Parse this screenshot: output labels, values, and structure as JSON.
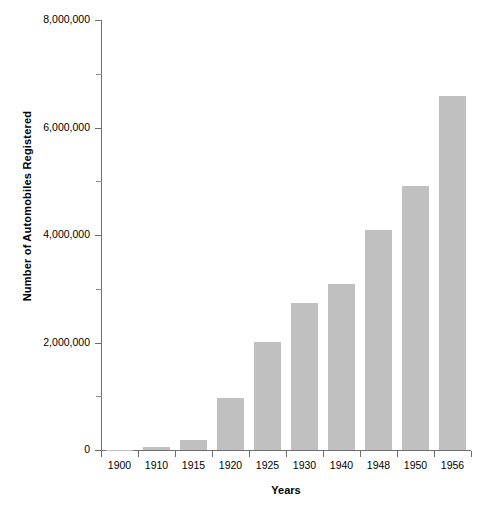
{
  "chart_data": {
    "type": "bar",
    "title": "",
    "subtitle": "",
    "xlabel": "Years",
    "ylabel": "Number of Automobiles Registered",
    "categories": [
      "1900",
      "1910",
      "1915",
      "1920",
      "1925",
      "1930",
      "1940",
      "1948",
      "1950",
      "1956"
    ],
    "values": [
      8000,
      55000,
      190000,
      960000,
      2010000,
      2740000,
      3090000,
      4090000,
      4910000,
      6580000
    ],
    "series": [
      {
        "name": "Automobiles Registered",
        "values": [
          8000,
          55000,
          190000,
          960000,
          2010000,
          2740000,
          3090000,
          4090000,
          4910000,
          6580000
        ]
      }
    ],
    "ylim": [
      0,
      8000000
    ],
    "ytick_values": [
      0,
      2000000,
      4000000,
      6000000,
      8000000
    ],
    "ytick_labels": [
      "0",
      "2,000,000",
      "4,000,000",
      "6,000,000",
      "8,000,000"
    ],
    "yminor_tick_values": [
      1000000,
      3000000,
      5000000,
      7000000
    ],
    "grid": false,
    "legend": false,
    "legend_position": "none",
    "bar_color": "#c0c0c0",
    "axis_color": "#6f6f6f",
    "background_color": "#ffffff",
    "text_color": "#000000"
  },
  "axes": {
    "y_title": "Number of Automobiles Registered",
    "x_title": "Years"
  }
}
